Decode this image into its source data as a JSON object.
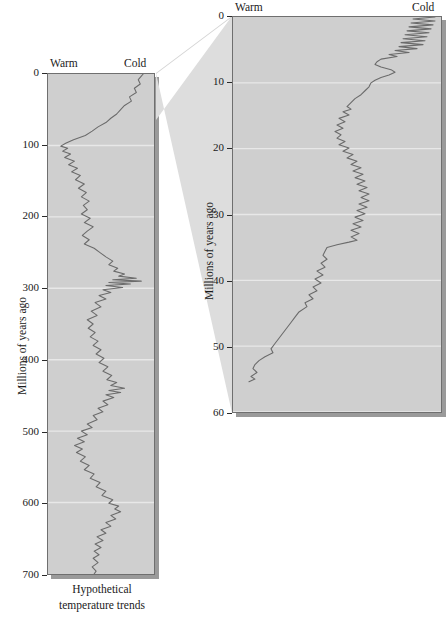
{
  "figure": {
    "caption": "Hypothetical\ntemperature trends",
    "caption_line1": "Hypothetical",
    "caption_line2": "temperature trends",
    "axis_title": "Millions of years ago",
    "warm_label": "Warm",
    "cold_label": "Cold",
    "background_color": "#cfcfcf",
    "curve_color": "#6b6b6b",
    "gridline_color": "#e8e8e8",
    "border_color": "#6f6f6f",
    "connector_color": "#dcdcdc"
  },
  "left_panel": {
    "axis_title": "Millions of years ago",
    "warm_label": "Warm",
    "cold_label": "Cold",
    "ticks": [
      "0",
      "100",
      "200",
      "300",
      "400",
      "500",
      "600",
      "700"
    ],
    "caption_line1": "Hypothetical",
    "caption_line2": "temperature trends"
  },
  "right_panel": {
    "axis_title": "Millions of years ago",
    "warm_label": "Warm",
    "cold_label": "Cold",
    "ticks": [
      "0",
      "10",
      "20",
      "30",
      "40",
      "50",
      "60"
    ]
  },
  "chart_data": [
    {
      "type": "line",
      "id": "left-panel-700my",
      "title": "Hypothetical temperature trends",
      "xlabel": "Temperature (Warm ← → Cold)",
      "ylabel": "Millions of years ago",
      "ylim": [
        0,
        700
      ],
      "xlim": [
        0,
        1
      ],
      "x_axis_direction": "warm-left-cold-right",
      "y_axis_direction": "inverted-top-is-zero",
      "grid": true,
      "gridlines_y": [
        100,
        200,
        300,
        400,
        500,
        600
      ],
      "tick_labels": [
        "0",
        "100",
        "200",
        "300",
        "400",
        "500",
        "600",
        "700"
      ],
      "annotations": [
        "Warm",
        "Cold"
      ],
      "note": "Relative temperature where 0 = warmest (left edge) and 1 = coldest (right edge)",
      "points": [
        [
          0.93,
          0
        ],
        [
          0.88,
          8
        ],
        [
          0.9,
          14
        ],
        [
          0.84,
          20
        ],
        [
          0.86,
          26
        ],
        [
          0.79,
          32
        ],
        [
          0.81,
          38
        ],
        [
          0.74,
          44
        ],
        [
          0.7,
          50
        ],
        [
          0.66,
          56
        ],
        [
          0.6,
          62
        ],
        [
          0.55,
          68
        ],
        [
          0.47,
          74
        ],
        [
          0.41,
          80
        ],
        [
          0.34,
          86
        ],
        [
          0.22,
          92
        ],
        [
          0.14,
          97
        ],
        [
          0.09,
          101
        ],
        [
          0.16,
          104
        ],
        [
          0.11,
          108
        ],
        [
          0.19,
          112
        ],
        [
          0.13,
          117
        ],
        [
          0.23,
          122
        ],
        [
          0.17,
          127
        ],
        [
          0.26,
          132
        ],
        [
          0.2,
          137
        ],
        [
          0.29,
          142
        ],
        [
          0.24,
          148
        ],
        [
          0.33,
          154
        ],
        [
          0.27,
          160
        ],
        [
          0.35,
          166
        ],
        [
          0.3,
          172
        ],
        [
          0.38,
          178
        ],
        [
          0.32,
          184
        ],
        [
          0.36,
          190
        ],
        [
          0.3,
          196
        ],
        [
          0.39,
          202
        ],
        [
          0.33,
          208
        ],
        [
          0.42,
          214
        ],
        [
          0.36,
          220
        ],
        [
          0.31,
          226
        ],
        [
          0.38,
          232
        ],
        [
          0.33,
          238
        ],
        [
          0.43,
          244
        ],
        [
          0.49,
          250
        ],
        [
          0.55,
          256
        ],
        [
          0.62,
          262
        ],
        [
          0.58,
          267
        ],
        [
          0.67,
          272
        ],
        [
          0.63,
          276
        ],
        [
          0.74,
          280
        ],
        [
          0.68,
          283
        ],
        [
          0.86,
          286
        ],
        [
          0.62,
          288
        ],
        [
          0.91,
          290
        ],
        [
          0.58,
          292
        ],
        [
          0.8,
          294
        ],
        [
          0.55,
          296
        ],
        [
          0.72,
          299
        ],
        [
          0.52,
          302
        ],
        [
          0.6,
          306
        ],
        [
          0.48,
          310
        ],
        [
          0.55,
          315
        ],
        [
          0.44,
          320
        ],
        [
          0.5,
          326
        ],
        [
          0.4,
          332
        ],
        [
          0.46,
          338
        ],
        [
          0.36,
          344
        ],
        [
          0.42,
          350
        ],
        [
          0.37,
          356
        ],
        [
          0.44,
          362
        ],
        [
          0.39,
          368
        ],
        [
          0.47,
          374
        ],
        [
          0.42,
          380
        ],
        [
          0.5,
          386
        ],
        [
          0.45,
          392
        ],
        [
          0.53,
          398
        ],
        [
          0.48,
          404
        ],
        [
          0.57,
          410
        ],
        [
          0.52,
          416
        ],
        [
          0.61,
          422
        ],
        [
          0.56,
          428
        ],
        [
          0.66,
          432
        ],
        [
          0.6,
          436
        ],
        [
          0.74,
          440
        ],
        [
          0.58,
          443
        ],
        [
          0.7,
          446
        ],
        [
          0.55,
          449
        ],
        [
          0.63,
          453
        ],
        [
          0.52,
          458
        ],
        [
          0.57,
          463
        ],
        [
          0.47,
          468
        ],
        [
          0.52,
          473
        ],
        [
          0.42,
          478
        ],
        [
          0.46,
          484
        ],
        [
          0.36,
          490
        ],
        [
          0.41,
          495
        ],
        [
          0.3,
          500
        ],
        [
          0.36,
          505
        ],
        [
          0.26,
          510
        ],
        [
          0.33,
          515
        ],
        [
          0.23,
          520
        ],
        [
          0.31,
          525
        ],
        [
          0.25,
          530
        ],
        [
          0.34,
          536
        ],
        [
          0.29,
          542
        ],
        [
          0.38,
          548
        ],
        [
          0.33,
          554
        ],
        [
          0.43,
          560
        ],
        [
          0.39,
          566
        ],
        [
          0.49,
          572
        ],
        [
          0.45,
          578
        ],
        [
          0.55,
          584
        ],
        [
          0.51,
          590
        ],
        [
          0.62,
          596
        ],
        [
          0.58,
          601
        ],
        [
          0.68,
          605
        ],
        [
          0.64,
          609
        ],
        [
          0.7,
          613
        ],
        [
          0.6,
          618
        ],
        [
          0.65,
          623
        ],
        [
          0.55,
          628
        ],
        [
          0.6,
          633
        ],
        [
          0.5,
          638
        ],
        [
          0.55,
          643
        ],
        [
          0.46,
          648
        ],
        [
          0.52,
          653
        ],
        [
          0.44,
          658
        ],
        [
          0.5,
          663
        ],
        [
          0.43,
          668
        ],
        [
          0.48,
          673
        ],
        [
          0.42,
          678
        ],
        [
          0.47,
          684
        ],
        [
          0.41,
          690
        ],
        [
          0.45,
          696
        ],
        [
          0.43,
          700
        ]
      ]
    },
    {
      "type": "line",
      "id": "right-panel-60my-detail",
      "title": "Detail: last 60 million years",
      "xlabel": "Temperature (Warm ← → Cold)",
      "ylabel": "Millions of years ago",
      "ylim": [
        0,
        60
      ],
      "xlim": [
        0,
        1
      ],
      "x_axis_direction": "warm-left-cold-right",
      "y_axis_direction": "inverted-top-is-zero",
      "grid": true,
      "gridlines_y": [
        10,
        20,
        30,
        40,
        50,
        60
      ],
      "tick_labels": [
        "0",
        "10",
        "20",
        "30",
        "40",
        "50",
        "60"
      ],
      "annotations": [
        "Warm",
        "Cold"
      ],
      "note": "Relative temperature where 0 = warmest (left edge) and 1 = coldest (right edge)",
      "points": [
        [
          0.99,
          0.0
        ],
        [
          0.88,
          0.3
        ],
        [
          0.99,
          0.6
        ],
        [
          0.87,
          0.9
        ],
        [
          0.98,
          1.2
        ],
        [
          0.86,
          1.5
        ],
        [
          0.97,
          1.8
        ],
        [
          0.85,
          2.1
        ],
        [
          0.96,
          2.4
        ],
        [
          0.84,
          2.7
        ],
        [
          0.95,
          3.0
        ],
        [
          0.83,
          3.3
        ],
        [
          0.94,
          3.6
        ],
        [
          0.82,
          3.9
        ],
        [
          0.93,
          4.2
        ],
        [
          0.81,
          4.5
        ],
        [
          0.9,
          4.8
        ],
        [
          0.79,
          5.1
        ],
        [
          0.86,
          5.4
        ],
        [
          0.76,
          5.7
        ],
        [
          0.8,
          6.0
        ],
        [
          0.72,
          6.4
        ],
        [
          0.7,
          6.8
        ],
        [
          0.69,
          7.2
        ],
        [
          0.72,
          7.6
        ],
        [
          0.77,
          8.0
        ],
        [
          0.79,
          8.4
        ],
        [
          0.76,
          8.8
        ],
        [
          0.72,
          9.2
        ],
        [
          0.69,
          9.6
        ],
        [
          0.67,
          10.0
        ],
        [
          0.66,
          10.6
        ],
        [
          0.64,
          11.2
        ],
        [
          0.62,
          11.8
        ],
        [
          0.59,
          12.4
        ],
        [
          0.57,
          13.0
        ],
        [
          0.55,
          13.6
        ],
        [
          0.57,
          14.0
        ],
        [
          0.53,
          14.4
        ],
        [
          0.56,
          14.9
        ],
        [
          0.51,
          15.4
        ],
        [
          0.54,
          15.9
        ],
        [
          0.5,
          16.4
        ],
        [
          0.53,
          16.9
        ],
        [
          0.49,
          17.4
        ],
        [
          0.52,
          17.9
        ],
        [
          0.5,
          18.4
        ],
        [
          0.54,
          18.9
        ],
        [
          0.51,
          19.4
        ],
        [
          0.56,
          19.9
        ],
        [
          0.53,
          20.4
        ],
        [
          0.58,
          20.9
        ],
        [
          0.55,
          21.4
        ],
        [
          0.6,
          21.9
        ],
        [
          0.57,
          22.4
        ],
        [
          0.62,
          22.9
        ],
        [
          0.58,
          23.4
        ],
        [
          0.63,
          23.9
        ],
        [
          0.59,
          24.4
        ],
        [
          0.64,
          24.9
        ],
        [
          0.6,
          25.4
        ],
        [
          0.65,
          25.9
        ],
        [
          0.61,
          26.4
        ],
        [
          0.66,
          26.9
        ],
        [
          0.62,
          27.4
        ],
        [
          0.66,
          27.9
        ],
        [
          0.61,
          28.4
        ],
        [
          0.65,
          28.9
        ],
        [
          0.6,
          29.4
        ],
        [
          0.64,
          29.9
        ],
        [
          0.59,
          30.4
        ],
        [
          0.63,
          30.9
        ],
        [
          0.58,
          31.4
        ],
        [
          0.62,
          31.9
        ],
        [
          0.57,
          32.4
        ],
        [
          0.61,
          32.9
        ],
        [
          0.57,
          33.4
        ],
        [
          0.6,
          33.9
        ],
        [
          0.56,
          34.2
        ],
        [
          0.5,
          34.6
        ],
        [
          0.45,
          35.0
        ],
        [
          0.44,
          35.6
        ],
        [
          0.43,
          36.2
        ],
        [
          0.45,
          36.8
        ],
        [
          0.42,
          37.4
        ],
        [
          0.44,
          38.0
        ],
        [
          0.4,
          38.6
        ],
        [
          0.43,
          39.2
        ],
        [
          0.39,
          39.8
        ],
        [
          0.42,
          40.4
        ],
        [
          0.38,
          41.0
        ],
        [
          0.4,
          41.6
        ],
        [
          0.36,
          42.2
        ],
        [
          0.38,
          42.8
        ],
        [
          0.34,
          43.4
        ],
        [
          0.35,
          44.0
        ],
        [
          0.31,
          44.8
        ],
        [
          0.29,
          45.6
        ],
        [
          0.27,
          46.4
        ],
        [
          0.25,
          47.2
        ],
        [
          0.23,
          48.0
        ],
        [
          0.21,
          48.8
        ],
        [
          0.19,
          49.6
        ],
        [
          0.17,
          50.4
        ],
        [
          0.18,
          51.0
        ],
        [
          0.14,
          51.6
        ],
        [
          0.11,
          52.2
        ],
        [
          0.09,
          52.8
        ],
        [
          0.08,
          53.4
        ],
        [
          0.1,
          54.0
        ],
        [
          0.07,
          54.6
        ],
        [
          0.09,
          55.0
        ],
        [
          0.06,
          55.4
        ]
      ]
    }
  ]
}
